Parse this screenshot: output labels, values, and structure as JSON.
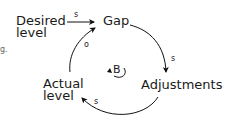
{
  "diagram": {
    "type": "causal-loop",
    "nodes": {
      "desired_level": "Desired\nlevel",
      "gap": "Gap",
      "adjustments": "Adjustments",
      "actual_level": "Actual\nlevel"
    },
    "links": [
      {
        "from": "Desired level",
        "to": "Gap",
        "polarity": "s"
      },
      {
        "from": "Gap",
        "to": "Adjustments",
        "polarity": "s"
      },
      {
        "from": "Adjustments",
        "to": "Actual level",
        "polarity": "s"
      },
      {
        "from": "Actual level",
        "to": "Gap",
        "polarity": "o"
      }
    ],
    "polarity_labels": {
      "desired_gap": "s",
      "gap_adjust": "s",
      "adjust_actual": "s",
      "actual_gap": "o"
    },
    "loop_label": "B",
    "edge_fragment": "g."
  }
}
